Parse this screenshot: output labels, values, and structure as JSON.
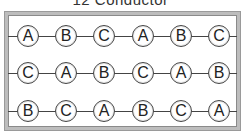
{
  "title": "12 Conductor",
  "colors": {
    "frame": "#bdbdbd",
    "wire": "#444444",
    "node_border": "#444444"
  },
  "rows": [
    {
      "phases": [
        "A",
        "B",
        "C",
        "A",
        "B",
        "C"
      ]
    },
    {
      "phases": [
        "C",
        "A",
        "B",
        "C",
        "A",
        "B"
      ]
    },
    {
      "phases": [
        "B",
        "C",
        "A",
        "B",
        "C",
        "A"
      ]
    }
  ]
}
